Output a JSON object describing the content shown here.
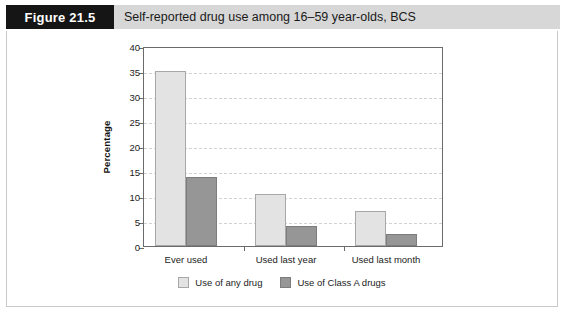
{
  "figure": {
    "tag": "Figure 21.5",
    "caption": "Self-reported drug use among 16–59 year-olds, BCS"
  },
  "legend": {
    "items": [
      {
        "label": "Use of any drug",
        "swatch": "light-gray-swatch",
        "color": "#e3e3e3"
      },
      {
        "label": "Use of Class A drugs",
        "swatch": "dark-gray-swatch",
        "color": "#969696"
      }
    ]
  },
  "axis": {
    "y_ticks": [
      "0",
      "5",
      "10",
      "15",
      "20",
      "25",
      "30",
      "35",
      "40"
    ],
    "y_title": "Percentage"
  },
  "chart_data": {
    "type": "bar",
    "title": "Self-reported drug use among 16–59 year-olds, BCS",
    "xlabel": "",
    "ylabel": "Percentage",
    "ylim": [
      0,
      40
    ],
    "ytick_step": 5,
    "grid": true,
    "legend_position": "bottom-center",
    "categories": [
      "Ever used",
      "Used last year",
      "Used last month"
    ],
    "series": [
      {
        "name": "Use of any drug",
        "color": "#e3e3e3",
        "values": [
          35.0,
          10.5,
          7.0
        ]
      },
      {
        "name": "Use of Class A drugs",
        "color": "#969696",
        "values": [
          13.9,
          4.0,
          2.5
        ]
      }
    ]
  }
}
